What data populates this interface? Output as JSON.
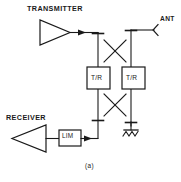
{
  "figure": {
    "caption": "(a)",
    "type": "rf-circuit-block-diagram",
    "stroke_color": "#1a1a1a",
    "background_color": "#ffffff"
  },
  "labels": {
    "transmitter": "TRANSMITTER",
    "receiver": "RECEIVER",
    "antenna": "ANT",
    "tr_switch_left": "T/R",
    "tr_switch_right": "T/R",
    "limiter": "LIM"
  },
  "blocks": [
    {
      "name": "transmitter-amplifier",
      "label": "TRANSMITTER",
      "shape": "triangle-right"
    },
    {
      "name": "receiver-amplifier",
      "label": "RECEIVER",
      "shape": "triangle-left"
    },
    {
      "name": "tr-switch-left",
      "label": "T/R",
      "shape": "rectangle"
    },
    {
      "name": "tr-switch-right",
      "label": "T/R",
      "shape": "rectangle"
    },
    {
      "name": "limiter",
      "label": "LIM",
      "shape": "rectangle"
    },
    {
      "name": "antenna-port",
      "label": "ANT",
      "shape": "antenna-arrow"
    },
    {
      "name": "termination-load",
      "label": "",
      "shape": "ground-resistor"
    }
  ],
  "couplers": [
    {
      "name": "coupler-top",
      "crossing": "X"
    },
    {
      "name": "coupler-bottom",
      "crossing": "X"
    }
  ]
}
